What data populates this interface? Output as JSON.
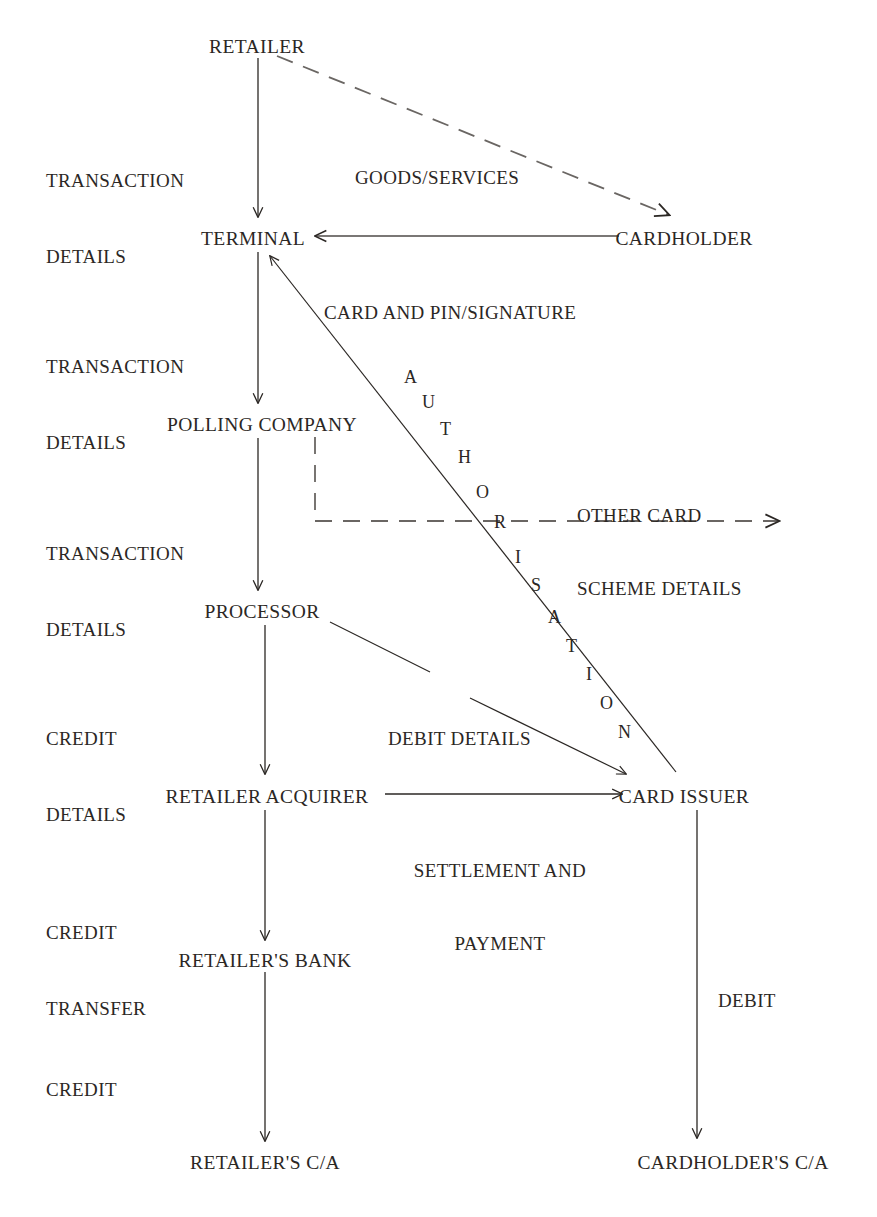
{
  "diagram": {
    "background_color": "#ffffff",
    "ink_color": "#2b2724",
    "nodes": [
      {
        "id": "retailer",
        "label": "RETAILER",
        "x": 257,
        "y": 36,
        "align": "center"
      },
      {
        "id": "terminal",
        "label": "TERMINAL",
        "x": 253,
        "y": 228,
        "align": "center"
      },
      {
        "id": "cardholder",
        "label": "CARDHOLDER",
        "x": 684,
        "y": 228,
        "align": "center"
      },
      {
        "id": "polling-company",
        "label": "POLLING COMPANY",
        "x": 262,
        "y": 414,
        "align": "center"
      },
      {
        "id": "processor",
        "label": "PROCESSOR",
        "x": 262,
        "y": 601,
        "align": "center"
      },
      {
        "id": "retailer-acquirer",
        "label": "RETAILER ACQUIRER",
        "x": 267,
        "y": 786,
        "align": "center"
      },
      {
        "id": "card-issuer",
        "label": "CARD ISSUER",
        "x": 684,
        "y": 786,
        "align": "center"
      },
      {
        "id": "retailers-bank",
        "label": "RETAILER'S BANK",
        "x": 265,
        "y": 950,
        "align": "center"
      },
      {
        "id": "retailers-ca",
        "label": "RETAILER'S C/A",
        "x": 265,
        "y": 1152,
        "align": "center"
      },
      {
        "id": "cardholders-ca",
        "label": "CARDHOLDER'S C/A",
        "x": 733,
        "y": 1152,
        "align": "center"
      }
    ],
    "side_labels": [
      {
        "id": "transaction-details-1",
        "lines": [
          "TRANSACTION",
          "DETAILS"
        ],
        "x": 46,
        "y": 117
      },
      {
        "id": "transaction-details-2",
        "lines": [
          "TRANSACTION",
          "DETAILS"
        ],
        "x": 46,
        "y": 303
      },
      {
        "id": "transaction-details-3",
        "lines": [
          "TRANSACTION",
          "DETAILS"
        ],
        "x": 46,
        "y": 490
      },
      {
        "id": "credit-details",
        "lines": [
          "CREDIT",
          "DETAILS"
        ],
        "x": 46,
        "y": 675
      },
      {
        "id": "credit-transfer",
        "lines": [
          "CREDIT",
          "TRANSFER"
        ],
        "x": 46,
        "y": 869
      },
      {
        "id": "credit",
        "lines": [
          "CREDIT"
        ],
        "x": 46,
        "y": 1026
      }
    ],
    "edge_labels": [
      {
        "id": "goods-services",
        "lines": [
          "GOODS/SERVICES"
        ],
        "x": 355,
        "y": 117
      },
      {
        "id": "card-and-pin-signature",
        "lines": [
          "CARD AND PIN/SIGNATURE"
        ],
        "x": 324,
        "y": 252
      },
      {
        "id": "other-card-scheme",
        "lines": [
          "OTHER CARD",
          "SCHEME DETAILS"
        ],
        "x": 577,
        "y": 455
      },
      {
        "id": "debit-details",
        "lines": [
          "DEBIT DETAILS"
        ],
        "x": 388,
        "y": 678
      },
      {
        "id": "settlement-and-payment",
        "lines": [
          "SETTLEMENT AND",
          "PAYMENT"
        ],
        "x": 418,
        "y": 810,
        "align": "center"
      },
      {
        "id": "debit",
        "lines": [
          "DEBIT"
        ],
        "x": 718,
        "y": 940
      }
    ],
    "authorisation": {
      "word": "AUTHORISATION",
      "letters": [
        {
          "char": "A",
          "x": 404,
          "y": 368
        },
        {
          "char": "U",
          "x": 422,
          "y": 393
        },
        {
          "char": "T",
          "x": 440,
          "y": 420
        },
        {
          "char": "H",
          "x": 458,
          "y": 448
        },
        {
          "char": "O",
          "x": 476,
          "y": 483
        },
        {
          "char": "R",
          "x": 494,
          "y": 513
        },
        {
          "char": "I",
          "x": 515,
          "y": 548
        },
        {
          "char": "S",
          "x": 531,
          "y": 576
        },
        {
          "char": "A",
          "x": 548,
          "y": 608
        },
        {
          "char": "T",
          "x": 566,
          "y": 637
        },
        {
          "char": "I",
          "x": 586,
          "y": 665
        },
        {
          "char": "O",
          "x": 600,
          "y": 694
        },
        {
          "char": "N",
          "x": 618,
          "y": 723
        }
      ]
    },
    "connections": [
      {
        "id": "retailer-to-terminal",
        "from": "retailer",
        "to": "terminal",
        "style": "solid",
        "label": "TRANSACTION DETAILS"
      },
      {
        "id": "retailer-to-cardholder",
        "from": "retailer",
        "to": "cardholder",
        "style": "dashed",
        "label": "GOODS/SERVICES"
      },
      {
        "id": "cardholder-to-terminal",
        "from": "cardholder",
        "to": "terminal",
        "style": "solid",
        "label": "CARD AND PIN/SIGNATURE"
      },
      {
        "id": "terminal-to-polling-company",
        "from": "terminal",
        "to": "polling-company",
        "style": "solid",
        "label": "TRANSACTION DETAILS"
      },
      {
        "id": "polling-company-to-other-schemes",
        "from": "polling-company",
        "to": "other card schemes",
        "style": "dashed",
        "label": "OTHER CARD SCHEME DETAILS"
      },
      {
        "id": "polling-company-to-processor",
        "from": "polling-company",
        "to": "processor",
        "style": "solid",
        "label": "TRANSACTION DETAILS"
      },
      {
        "id": "processor-to-retailer-acquirer",
        "from": "processor",
        "to": "retailer-acquirer",
        "style": "solid",
        "label": "CREDIT DETAILS"
      },
      {
        "id": "processor-to-card-issuer",
        "from": "processor",
        "to": "card-issuer",
        "style": "solid",
        "label": "DEBIT DETAILS"
      },
      {
        "id": "card-issuer-to-terminal",
        "from": "card-issuer",
        "to": "terminal",
        "style": "solid",
        "label": "AUTHORISATION"
      },
      {
        "id": "retailer-acquirer-to-card-issuer",
        "from": "retailer-acquirer",
        "to": "card-issuer",
        "style": "solid",
        "label": "SETTLEMENT AND PAYMENT"
      },
      {
        "id": "retailer-acquirer-to-bank",
        "from": "retailer-acquirer",
        "to": "retailers-bank",
        "style": "solid",
        "label": "CREDIT TRANSFER"
      },
      {
        "id": "bank-to-retailers-ca",
        "from": "retailers-bank",
        "to": "retailers-ca",
        "style": "solid",
        "label": "CREDIT"
      },
      {
        "id": "card-issuer-to-cardholders-ca",
        "from": "card-issuer",
        "to": "cardholders-ca",
        "style": "solid",
        "label": "DEBIT"
      }
    ]
  }
}
